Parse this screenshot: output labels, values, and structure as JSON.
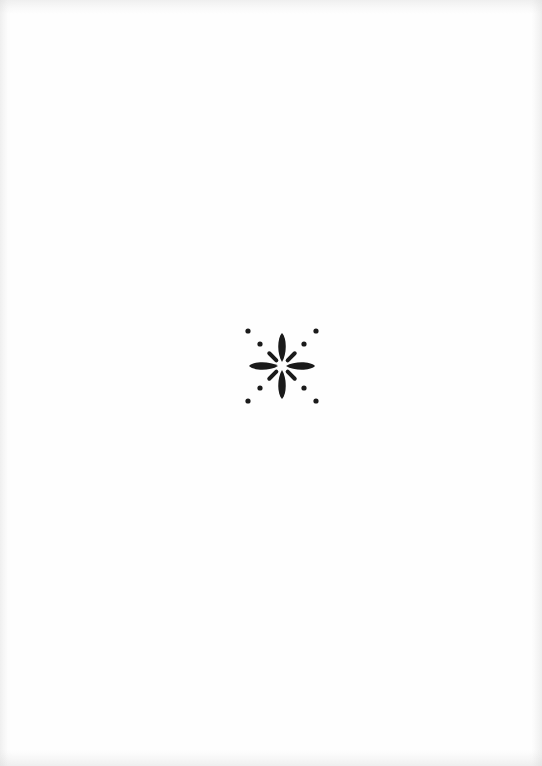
{
  "page": {
    "type": "blank-page-with-ornament",
    "background_color": "#fefefe"
  },
  "ornament": {
    "icon": "fleuron-flower-icon",
    "description": "four-petal flower with diagonal dashes and dots",
    "color": "#1a1a1a",
    "center": [
      282,
      366
    ]
  }
}
